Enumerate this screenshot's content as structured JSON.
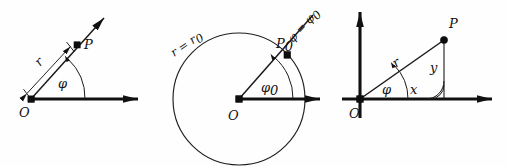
{
  "figure": {
    "background_color": "#fefefe",
    "ink_color": "#111111",
    "panel_count": 3
  },
  "panels": [
    {
      "id": "polar-point",
      "caption": "",
      "origin_label": "O",
      "point_label": "P",
      "radius_label": "r",
      "angle_label": "φ",
      "axis_label": "",
      "elements": {
        "polar_axis": "horizontal ray from O",
        "radial_ray": "ray through P with arrowhead",
        "angle_arc": "arc from polar axis to radial ray",
        "dimension_line": "double-headed measure of r"
      }
    },
    {
      "id": "circle-radius",
      "caption": "",
      "origin_label": "O",
      "point_label": "P₀",
      "radius_label": "r = r₀",
      "radius_label_parts": {
        "lhs": "r = r",
        "sub": "0"
      },
      "angle_label": "φ₀",
      "angle_label_parts": {
        "base": "φ",
        "sub": "0"
      },
      "ray_label": "φ = φ₀",
      "ray_label_parts": {
        "lhs": "φ = φ",
        "sub": "0"
      },
      "point_label_parts": {
        "base": "P",
        "sub": "0"
      },
      "elements": {
        "coordinate_circle": "circle of constant radius r0 centred at O",
        "polar_axis": "horizontal ray from O",
        "radial_ray": "ray of constant angle phi0 through P0",
        "angle_arc": "arc marking phi0"
      }
    },
    {
      "id": "cartesian",
      "caption": "",
      "origin_label": "O",
      "point_label": "P",
      "radius_label": "r",
      "angle_label": "φ",
      "x_label": "x",
      "y_label": "y",
      "right_angle_label": "",
      "elements": {
        "x_axis": "horizontal axis with arrowhead",
        "y_axis": "vertical axis with arrowhead",
        "radius_segment": "segment from O to P labelled r",
        "ordinate_segment": "vertical segment labelled y",
        "abscissa_segment": "horizontal projection labelled x",
        "angle_arc": "arc marking phi",
        "right_angle_mark": "double arc right angle at foot of ordinate"
      }
    }
  ]
}
